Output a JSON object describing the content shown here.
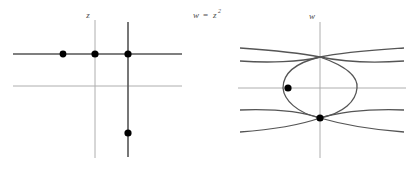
{
  "figure": {
    "background_color": "#ffffff",
    "width": 417,
    "height": 170
  },
  "map_label": {
    "variable": "w",
    "equals": "=",
    "base": "z",
    "exponent": "2",
    "full_text": "w = z²",
    "color": "#4d4d4d"
  },
  "left_panel": {
    "name": "z-plane",
    "axis_label": "z",
    "axis_label_color": "#4d4d4d",
    "colors": {
      "dark_line": "#555555",
      "light_line": "#aaaaaa",
      "dot": "#000000"
    },
    "horizontal_lines": [
      {
        "name": "upper-horizontal-line",
        "y": 54,
        "x1": 13,
        "x2": 182,
        "shade": "dark",
        "width": 1.6
      },
      {
        "name": "lower-horizontal-line",
        "y": 86,
        "x1": 13,
        "x2": 182,
        "shade": "light",
        "width": 1.0
      }
    ],
    "vertical_lines": [
      {
        "name": "imaginary-axis",
        "x": 95,
        "y1": 20,
        "y2": 158,
        "shade": "light",
        "width": 1.0
      },
      {
        "name": "vertical-line-right",
        "x": 128,
        "y1": 22,
        "y2": 157,
        "shade": "dark",
        "width": 1.6
      }
    ],
    "points": [
      {
        "name": "point-a",
        "x": 63,
        "y": 54,
        "r": 3.4
      },
      {
        "name": "point-b",
        "x": 95,
        "y": 54,
        "r": 3.6
      },
      {
        "name": "point-c",
        "x": 128,
        "y": 54,
        "r": 3.6
      },
      {
        "name": "point-d",
        "x": 128,
        "y": 133,
        "r": 3.6
      }
    ]
  },
  "right_panel": {
    "name": "w-plane",
    "axis_label": "w",
    "axis_label_color": "#4d4d4d",
    "colors": {
      "curve": "#555555",
      "axis": "#aaaaaa",
      "dot": "#000000"
    },
    "axes": [
      {
        "name": "real-axis",
        "orientation": "horizontal",
        "y": 88,
        "x1": 238,
        "x2": 406,
        "width": 1.0
      },
      {
        "name": "imaginary-axis",
        "orientation": "vertical",
        "x": 320,
        "y1": 22,
        "y2": 158,
        "width": 1.0
      }
    ],
    "curves": [
      {
        "name": "closed-lens-curve",
        "description": "closed oval image of the vertical segment",
        "path": "M 320 57 C 352 68 358 80 357 88 C 356 101 344 113 320 118 C 297 113 284 100 283 88 C 283 74 295 63 320 57 Z",
        "width": 1.3
      },
      {
        "name": "upper-parabola-branch",
        "description": "upward-opening branch pair crossing near the top",
        "path": "M 240 48 C 268 50 300 53 320 57 C 344 62 376 63 404 61",
        "width": 1.3
      },
      {
        "name": "upper-parabola-branch-mirror",
        "description": "mirror of the upper branch",
        "path": "M 240 61 C 268 63 300 62 320 57 C 344 52 376 50 404 48",
        "width": 1.3
      },
      {
        "name": "lower-parabola-branch",
        "description": "downward branch pair crossing near the bottom dot",
        "path": "M 240 132 C 268 130 300 125 320 118 C 344 111 376 109 404 110",
        "width": 1.3
      },
      {
        "name": "lower-parabola-branch-mirror",
        "description": "mirror of the lower branch",
        "path": "M 240 110 C 268 109 300 111 320 118 C 344 125 376 130 404 132",
        "width": 1.3
      }
    ],
    "points": [
      {
        "name": "image-point-left",
        "x": 288,
        "y": 88,
        "r": 3.6
      },
      {
        "name": "image-point-bottom",
        "x": 320,
        "y": 118,
        "r": 3.6
      }
    ]
  }
}
